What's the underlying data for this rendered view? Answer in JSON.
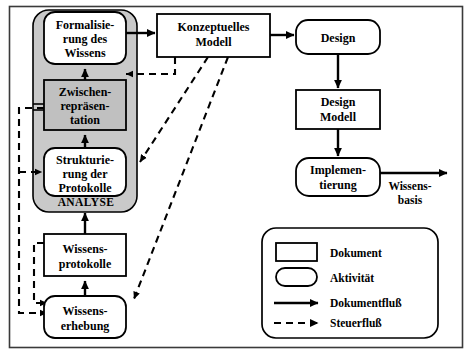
{
  "diagram": {
    "frame": {
      "border_color": "#2b2b2b",
      "background": "#ffffff"
    },
    "group": {
      "name": "ANALYSE",
      "label": "ANALYSE",
      "fill": "#c9c9c9",
      "stroke": "#000000"
    },
    "nodes": [
      {
        "id": "formalisierung",
        "kind": "aktivitaet",
        "lines": [
          "Formalisie-",
          "rung des",
          "Wissens"
        ],
        "fill": "#ffffff",
        "x": 44,
        "y": 12,
        "w": 82,
        "h": 52
      },
      {
        "id": "zwischenrepraesentation",
        "kind": "dokument",
        "lines": [
          "Zwischen-",
          "repräsen-",
          "tation"
        ],
        "fill": "#c0c0c0",
        "x": 44,
        "y": 80,
        "w": 82,
        "h": 50
      },
      {
        "id": "strukturierung",
        "kind": "aktivitaet",
        "lines": [
          "Strukturie-",
          "rung der",
          "Protokolle"
        ],
        "fill": "#ffffff",
        "x": 44,
        "y": 148,
        "w": 82,
        "h": 48
      },
      {
        "id": "wissensprotokolle",
        "kind": "dokument",
        "lines": [
          "Wissens-",
          "protokolle"
        ],
        "fill": "#ffffff",
        "x": 44,
        "y": 234,
        "w": 82,
        "h": 42
      },
      {
        "id": "wissenserhebung",
        "kind": "aktivitaet",
        "lines": [
          "Wissens-",
          "erhebung"
        ],
        "fill": "#ffffff",
        "x": 44,
        "y": 296,
        "w": 82,
        "h": 42
      },
      {
        "id": "konzeptuelles-modell",
        "kind": "dokument",
        "lines": [
          "Konzeptuelles",
          "Modell"
        ],
        "fill": "#ffffff",
        "x": 157,
        "y": 14,
        "w": 113,
        "h": 43
      },
      {
        "id": "design",
        "kind": "aktivitaet",
        "lines": [
          "Design"
        ],
        "fill": "#ffffff",
        "x": 296,
        "y": 20,
        "w": 84,
        "h": 34
      },
      {
        "id": "design-modell",
        "kind": "dokument",
        "lines": [
          "Design",
          "Modell"
        ],
        "fill": "#ffffff",
        "x": 296,
        "y": 90,
        "w": 84,
        "h": 39
      },
      {
        "id": "implementierung",
        "kind": "aktivitaet",
        "lines": [
          "Implemen-",
          "tierung"
        ],
        "fill": "#ffffff",
        "x": 296,
        "y": 158,
        "w": 84,
        "h": 38
      }
    ],
    "edge_labels": [
      {
        "id": "wissensbasis",
        "lines": [
          "Wissens-",
          "basis"
        ],
        "x": 410,
        "y": 188
      }
    ],
    "legend": {
      "x": 262,
      "y": 228,
      "w": 176,
      "h": 110,
      "items": [
        {
          "id": "dokument",
          "label": "Dokument",
          "symbol": "rectangle"
        },
        {
          "id": "aktivitaet",
          "label": "Aktivität",
          "symbol": "rounded-rectangle"
        },
        {
          "id": "dokumentfluss",
          "label": "Dokumentfluß",
          "symbol": "solid-arrow"
        },
        {
          "id": "steuerfluss",
          "label": "Steuerfluß",
          "symbol": "dashed-arrow"
        }
      ]
    },
    "flows": {
      "document_flow_color": "#000000",
      "control_flow_color": "#000000",
      "control_flow_dash": "7,5"
    }
  }
}
